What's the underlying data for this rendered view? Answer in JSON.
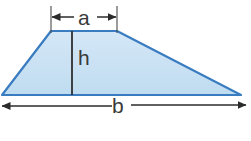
{
  "figure": {
    "type": "trapezoid-dimension-diagram",
    "background_color": "#ffffff",
    "shape": {
      "name": "trapezoid",
      "fill_color": "#c9e0f2",
      "stroke_color": "#3a7cc0",
      "stroke_width": 2.2,
      "vertices": [
        {
          "x": 2,
          "y": 95
        },
        {
          "x": 51,
          "y": 31
        },
        {
          "x": 117,
          "y": 31
        },
        {
          "x": 241,
          "y": 95
        }
      ]
    },
    "labels": {
      "top_side": "a",
      "height": "h",
      "base": "b"
    },
    "dimensions": {
      "a": {
        "label": "a",
        "line_y": 17,
        "x_start": 51,
        "x_end": 117,
        "arrow_direction": "inward",
        "extension_lines": [
          {
            "x": 51,
            "y_top": 7,
            "y_bottom": 33
          },
          {
            "x": 117,
            "y_top": 7,
            "y_bottom": 33
          }
        ],
        "color": "#3a3a3a"
      },
      "h": {
        "label": "h",
        "x": 72,
        "y_top": 31,
        "y_bottom": 95,
        "color": "#3a3a3a",
        "line_width": 1.8
      },
      "b": {
        "label": "b",
        "line_y": 106,
        "x_start": 1,
        "x_end": 247,
        "arrow_direction": "outward",
        "color": "#3a3a3a"
      }
    }
  }
}
